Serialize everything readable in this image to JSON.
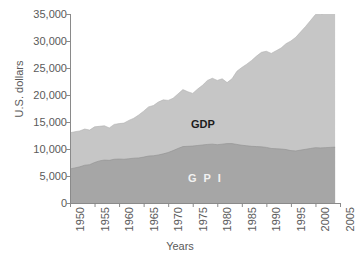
{
  "chart_data": {
    "type": "area",
    "stacked": true,
    "title": "",
    "xlabel": "Years",
    "ylabel": "U.S. dollars",
    "xlim": [
      1950,
      2005
    ],
    "ylim": [
      0,
      35000
    ],
    "grid": false,
    "legend_position": "inline-annotations",
    "xticks": [
      "1950",
      "1955",
      "1960",
      "1965",
      "1970",
      "1975",
      "1980",
      "1985",
      "1990",
      "1995",
      "2000",
      "2005"
    ],
    "xtick_values": [
      1950,
      1955,
      1960,
      1965,
      1970,
      1975,
      1980,
      1985,
      1990,
      1995,
      2000,
      2005
    ],
    "yticks": [
      "0",
      "5,000",
      "10,000",
      "15,000",
      "20,000",
      "25,000",
      "30,000",
      "35,000"
    ],
    "ytick_values": [
      0,
      5000,
      10000,
      15000,
      20000,
      25000,
      30000,
      35000
    ],
    "x": [
      1950,
      1951,
      1952,
      1953,
      1954,
      1955,
      1956,
      1957,
      1958,
      1959,
      1960,
      1961,
      1962,
      1963,
      1964,
      1965,
      1966,
      1967,
      1968,
      1969,
      1970,
      1971,
      1972,
      1973,
      1974,
      1975,
      1976,
      1977,
      1978,
      1979,
      1980,
      1981,
      1982,
      1983,
      1984,
      1985,
      1986,
      1987,
      1988,
      1989,
      1990,
      1991,
      1992,
      1993,
      1994,
      1995,
      1996,
      1997,
      1998,
      1999,
      2000,
      2001,
      2002,
      2003,
      2004
    ],
    "series": [
      {
        "name": "GPI",
        "color": "#a6a6a6",
        "label_text": "G P I",
        "values": [
          6300,
          6500,
          6700,
          7000,
          7100,
          7500,
          7800,
          7950,
          7900,
          8100,
          8150,
          8100,
          8200,
          8300,
          8350,
          8500,
          8700,
          8750,
          8900,
          9100,
          9350,
          9700,
          10100,
          10450,
          10500,
          10550,
          10650,
          10750,
          10850,
          10900,
          10800,
          10900,
          11000,
          11000,
          10850,
          10700,
          10600,
          10500,
          10450,
          10400,
          10300,
          10100,
          10050,
          10000,
          9900,
          9700,
          9650,
          9800,
          9950,
          10100,
          10250,
          10200,
          10250,
          10300,
          10350
        ]
      },
      {
        "name": "GDP",
        "color": "#c6c6c6",
        "label_text": "GDP",
        "values": [
          13000,
          13200,
          13350,
          13700,
          13500,
          14100,
          14200,
          14300,
          13900,
          14550,
          14700,
          14800,
          15300,
          15700,
          16300,
          17000,
          17800,
          18050,
          18700,
          19100,
          19000,
          19400,
          20200,
          21000,
          20600,
          20300,
          21100,
          21800,
          22700,
          23100,
          22700,
          23000,
          22300,
          23000,
          24400,
          25100,
          25700,
          26400,
          27200,
          27900,
          28100,
          27700,
          28200,
          28700,
          29500,
          30000,
          30700,
          31700,
          32700,
          33800,
          34900,
          34900,
          35200,
          35700,
          36100
        ]
      }
    ],
    "annotations": [
      {
        "text": "GDP",
        "role": "upper-band-label",
        "color": "#1c1c1c"
      },
      {
        "text": "G P I",
        "role": "lower-band-label",
        "color": "#f2f2f2"
      }
    ]
  },
  "axis": {
    "y_title": "U.S. dollars",
    "x_title": "Years"
  },
  "colors": {
    "background": "#ffffff",
    "axis": "#8a8a8a",
    "gdp_fill": "#c6c6c6",
    "gpi_fill": "#a6a6a6",
    "tick_text": "#5a5a5a"
  }
}
